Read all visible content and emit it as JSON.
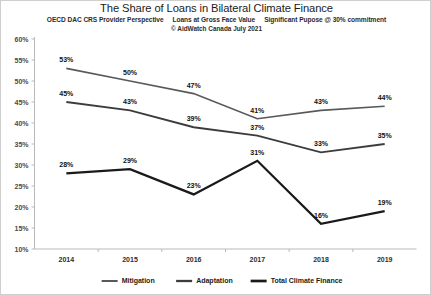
{
  "header": {
    "title": "The Share of Loans in Bilateral Climate Finance",
    "subtitle_parts": [
      "OECD DAC CRS Provider Perspective",
      "Loans at Gross Face Value",
      "Significant Pupose @ 30% commitment"
    ],
    "credit": "© AidWatch Canada July 2021"
  },
  "chart_data": {
    "type": "line",
    "title": "The Share of Loans in Bilateral Climate Finance",
    "subtitle": "OECD DAC CRS Provider Perspective   Loans at Gross Face Value   Significant Pupose @ 30% commitment",
    "credit": "© AidWatch Canada July 2021",
    "xlabel": "",
    "ylabel": "",
    "categories": [
      "2014",
      "2015",
      "2016",
      "2017",
      "2018",
      "2019"
    ],
    "ylim": [
      10,
      60
    ],
    "ytick_values": [
      10,
      15,
      20,
      25,
      30,
      35,
      40,
      45,
      50,
      55,
      60
    ],
    "ytick_labels": [
      "10%",
      "15%",
      "20%",
      "25%",
      "30%",
      "35%",
      "40%",
      "45%",
      "50%",
      "55%",
      "60%"
    ],
    "grid": false,
    "legend_position": "bottom",
    "value_suffix": "%",
    "series": [
      {
        "name": "Mitigation",
        "color": "#595959",
        "stroke_width": 1.6,
        "values": [
          53,
          50,
          47,
          41,
          43,
          44
        ],
        "labels": [
          "53%",
          "50%",
          "47%",
          "41%",
          "43%",
          "44%"
        ]
      },
      {
        "name": "Adaptation",
        "color": "#3c3c3c",
        "stroke_width": 1.9,
        "values": [
          45,
          43,
          39,
          37,
          33,
          35
        ],
        "labels": [
          "45%",
          "43%",
          "39%",
          "37%",
          "33%",
          "35%"
        ]
      },
      {
        "name": "Total Climate Finance",
        "color": "#1a1a1a",
        "stroke_width": 2.3,
        "values": [
          28,
          29,
          23,
          31,
          16,
          19
        ],
        "labels": [
          "28%",
          "29%",
          "23%",
          "31%",
          "16%",
          "19%"
        ]
      }
    ]
  }
}
